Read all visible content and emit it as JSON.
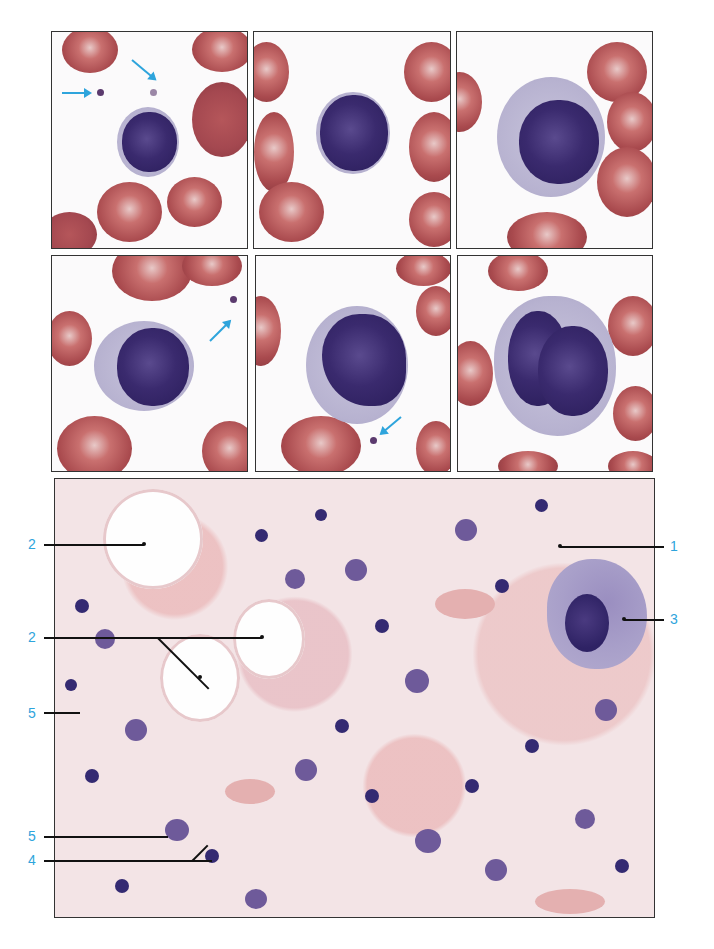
{
  "figure": {
    "smear_panels": [
      {
        "id": "a",
        "cell": "lymphocyte",
        "arrows": 2
      },
      {
        "id": "b",
        "cell": "lymphocyte",
        "arrows": 0
      },
      {
        "id": "c",
        "cell": "lymphocyte",
        "arrows": 0
      },
      {
        "id": "d",
        "cell": "monocyte",
        "arrows": 1
      },
      {
        "id": "e",
        "cell": "monocyte",
        "arrows": 1
      },
      {
        "id": "f",
        "cell": "monocyte",
        "arrows": 0
      }
    ],
    "marrow_section": {
      "labels": [
        {
          "text": "1",
          "side": "right"
        },
        {
          "text": "2",
          "side": "left"
        },
        {
          "text": "2",
          "side": "left"
        },
        {
          "text": "3",
          "side": "right"
        },
        {
          "text": "4",
          "side": "left"
        },
        {
          "text": "5",
          "side": "left"
        },
        {
          "text": "5",
          "side": "left"
        }
      ]
    },
    "colors": {
      "label": "#2ea4dc",
      "arrow": "#2ea4dc",
      "border": "#333333"
    }
  }
}
